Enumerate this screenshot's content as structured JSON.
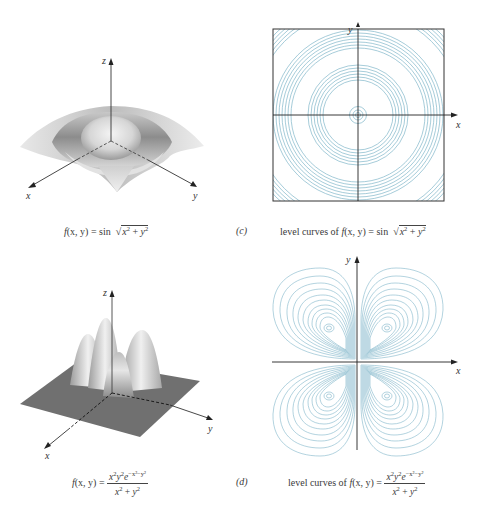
{
  "figure": {
    "panels": [
      {
        "id": "a",
        "kind": "surface-3d",
        "axes": {
          "x": "x",
          "y": "y",
          "z": "z"
        },
        "caption": {
          "lhs": "f(x, y) = ",
          "func": "sin",
          "radicand": "x² + y²",
          "full": "f(x, y) = sin √(x² + y²)"
        }
      },
      {
        "id": "c",
        "kind": "contour",
        "letter": "(c)",
        "axes": {
          "x": "x",
          "y": "y"
        },
        "caption": {
          "prefix": "level curves of ",
          "lhs": "f(x, y) = ",
          "func": "sin",
          "radicand": "x² + y²",
          "full": "level curves of f(x, y) = sin √(x² + y²)"
        }
      },
      {
        "id": "b",
        "kind": "surface-3d",
        "axes": {
          "x": "x",
          "y": "y",
          "z": "z"
        },
        "caption": {
          "lhs": "f(x, y) = ",
          "numerator": "x²y²e^(−x²−y²)",
          "denominator": "x² + y²",
          "full": "f(x, y) = x²y²e^(−x²−y²) / (x² + y²)"
        }
      },
      {
        "id": "d",
        "kind": "contour",
        "letter": "(d)",
        "axes": {
          "x": "x",
          "y": "y"
        },
        "caption": {
          "prefix": "level curves of ",
          "lhs": "f(x, y) = ",
          "numerator": "x²y²e^(−x²−y²)",
          "denominator": "x² + y²",
          "full": "level curves of f(x, y) = x²y²e^(−x²−y²) / (x² + y²)"
        }
      }
    ],
    "colors": {
      "contour": "#7fb6c9",
      "axis": "#222222",
      "surface_plate": "#707070"
    }
  },
  "labels": {
    "x": "x",
    "y": "y",
    "z": "z",
    "sin": "sin",
    "c_letter": "(c)",
    "d_letter": "(d)",
    "level_prefix": "level curves of ",
    "f_lhs_a": "f",
    "f_args": "(x, y) = ",
    "rad_x": "x",
    "rad_y": "y",
    "two": "2",
    "plus": " + ",
    "num_x": "x",
    "num_y": "y",
    "num_e": "e",
    "num_exp": "−x²−y²"
  }
}
